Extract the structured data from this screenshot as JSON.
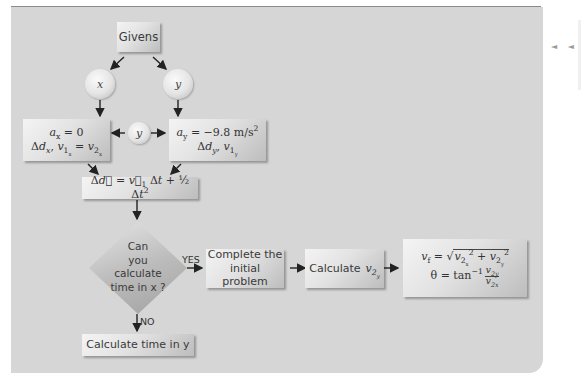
{
  "diagram": {
    "type": "flowchart",
    "nodes": {
      "givens": {
        "label": "Givens"
      },
      "x_circle": {
        "label": "x"
      },
      "y_circle_top": {
        "label": "y"
      },
      "y_circle_middle": {
        "label": "y"
      },
      "x_box": {
        "line1": "a_x = 0",
        "line2": "Δd_x, v1_x = v2_x"
      },
      "y_box": {
        "line1": "a_y = −9.8 m/s²",
        "line2": "Δd_y, v1_y"
      },
      "equation": {
        "label": "Δd = v1 Δt + ½ Δt²"
      },
      "decision": {
        "line1": "Can",
        "line2": "you",
        "line3": "calculate",
        "line4": "time in x ?"
      },
      "complete": {
        "line1": "Complete the",
        "line2": "initial problem"
      },
      "calc_v2y": {
        "label": "Calculate",
        "var": "v2y"
      },
      "result": {
        "line1": "v_f = √(v2x² + v2y²)",
        "line2": "θ = tan⁻¹ (v2y / v2x)"
      },
      "calc_time_y": {
        "label": "Calculate time in y"
      }
    },
    "edge_labels": {
      "yes": "YES",
      "no": "NO"
    }
  },
  "side_nav": {
    "icon": "◄ ◄"
  }
}
